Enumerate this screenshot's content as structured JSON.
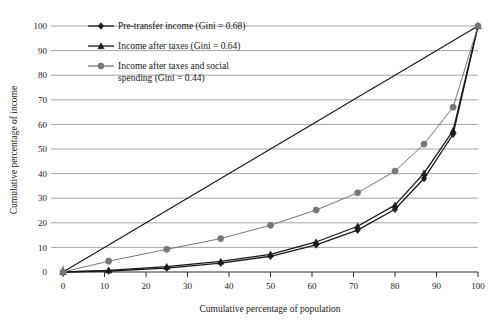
{
  "chart_data": {
    "type": "line",
    "title": "",
    "xlabel": "Cumulative percentage of population",
    "ylabel": "Cumulative percentage of income",
    "xlim": [
      0,
      100
    ],
    "ylim": [
      0,
      100
    ],
    "xticks": [
      0,
      10,
      20,
      30,
      40,
      50,
      60,
      70,
      80,
      90,
      100
    ],
    "yticks": [
      0,
      10,
      20,
      30,
      40,
      50,
      60,
      70,
      80,
      90,
      100
    ],
    "grid": "horizontal",
    "legend_position": "top-left-inside",
    "x": [
      0,
      11,
      25,
      38,
      50,
      61,
      71,
      80,
      87,
      94,
      100
    ],
    "series": [
      {
        "name": "Pre-transfer income (Gini = 0.68)",
        "marker": "diamond",
        "color": "#1a1a1a",
        "values": [
          0,
          0.4,
          1.6,
          3.6,
          6.4,
          11.0,
          17.0,
          25.5,
          38.0,
          56.0,
          100
        ]
      },
      {
        "name": "Income after taxes (Gini = 0.64)",
        "marker": "triangle",
        "color": "#1a1a1a",
        "values": [
          0,
          0.7,
          2.2,
          4.3,
          7.2,
          12.2,
          18.6,
          27.2,
          40.2,
          57.5,
          100
        ]
      },
      {
        "name": "Income after taxes and social spending (Gini = 0.44)",
        "marker": "circle",
        "color": "#777777",
        "values": [
          0,
          4.4,
          9.2,
          13.6,
          19.0,
          25.2,
          32.2,
          41.0,
          52.0,
          67.0,
          100
        ]
      },
      {
        "name": "line-of-equality",
        "marker": "none",
        "color": "#1a1a1a",
        "values": [
          0,
          11,
          25,
          38,
          50,
          61,
          71,
          80,
          87,
          94,
          100
        ]
      }
    ]
  },
  "legend": {
    "items": [
      {
        "label": "Pre-transfer income (Gini = 0.68)",
        "marker": "diamond",
        "color": "#1a1a1a"
      },
      {
        "label": "Income after taxes (Gini = 0.64)",
        "marker": "triangle",
        "color": "#1a1a1a"
      },
      {
        "label": "Income after taxes and social",
        "label2": "spending (Gini = 0.44)",
        "marker": "circle",
        "color": "#777777"
      }
    ]
  },
  "axes": {
    "x_title": "Cumulative percentage of population",
    "y_title": "Cumulative percentage of income",
    "x_ticks": [
      "0",
      "10",
      "20",
      "30",
      "40",
      "50",
      "60",
      "70",
      "80",
      "90",
      "100"
    ],
    "y_ticks": [
      "0",
      "10",
      "20",
      "30",
      "40",
      "50",
      "60",
      "70",
      "80",
      "90",
      "100"
    ]
  }
}
